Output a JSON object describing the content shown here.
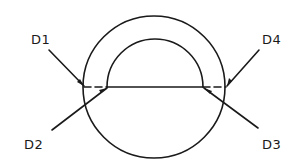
{
  "diagram": {
    "type": "cross-section",
    "stroke_color": "#1a1a1a",
    "background_color": "#ffffff",
    "shapes": {
      "outer_circle": {
        "cx": 154,
        "cy": 87,
        "r": 71
      },
      "inner_arc": {
        "cx": 155,
        "cy": 87,
        "r": 48,
        "span": "upper semicircle"
      },
      "chord": {
        "y": 87,
        "x_start": 83,
        "x_end": 226,
        "dashed_segments": [
          [
            83,
            108
          ],
          [
            202,
            226
          ]
        ]
      }
    },
    "labels": [
      {
        "id": "D1",
        "text": "D1",
        "x": 31,
        "y": 33,
        "leader": {
          "from": [
            49,
            50
          ],
          "to": [
            84,
            86
          ]
        }
      },
      {
        "id": "D2",
        "text": "D2",
        "x": 24,
        "y": 138,
        "leader": {
          "from": [
            52,
            130
          ],
          "to": [
            107,
            88
          ]
        }
      },
      {
        "id": "D3",
        "text": "D3",
        "x": 262,
        "y": 138,
        "leader": {
          "from": [
            258,
            128
          ],
          "to": [
            204,
            88
          ]
        }
      },
      {
        "id": "D4",
        "text": "D4",
        "x": 262,
        "y": 33,
        "leader": {
          "from": [
            259,
            50
          ],
          "to": [
            227,
            86
          ]
        }
      }
    ]
  }
}
